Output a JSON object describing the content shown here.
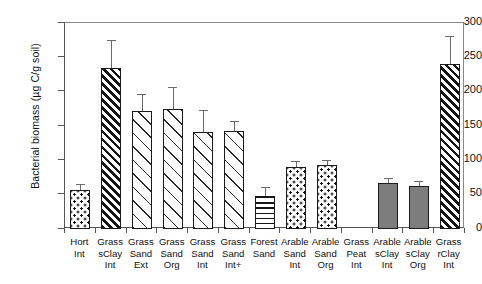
{
  "chart_data": {
    "type": "bar",
    "title": "",
    "xlabel": "",
    "ylabel": "Bacterial biomass (µg C/g soil)",
    "ylim": [
      0,
      300
    ],
    "ytick_labels": [
      "300",
      "250",
      "200",
      "150",
      "100",
      "50",
      "0"
    ],
    "ytick_values": [
      300,
      250,
      200,
      150,
      100,
      50,
      0
    ],
    "grid": false,
    "legend": "none",
    "categories": [
      "Hort Int",
      "Grass sClay Int",
      "Grass Sand Ext",
      "Grass Sand Org",
      "Grass Sand Int",
      "Grass Sand Int+",
      "Forest Sand",
      "Arable Sand Int",
      "Arable Sand Org",
      "Grass Peat Int",
      "Arable sClay Int",
      "Arable sClay Org",
      "Grass rClay Int"
    ],
    "category_lines": [
      [
        "Hort",
        "Int"
      ],
      [
        "Grass",
        "sClay",
        "Int"
      ],
      [
        "Grass",
        "Sand",
        "Ext"
      ],
      [
        "Grass",
        "Sand",
        "Org"
      ],
      [
        "Grass",
        "Sand",
        "Int"
      ],
      [
        "Grass",
        "Sand",
        "Int+"
      ],
      [
        "Forest",
        "Sand"
      ],
      [
        "Arable",
        "Sand",
        "Int"
      ],
      [
        "Arable",
        "Sand",
        "Org"
      ],
      [
        "Grass",
        "Peat",
        "Int"
      ],
      [
        "Arable",
        "sClay",
        "Int"
      ],
      [
        "Arable",
        "sClay",
        "Org"
      ],
      [
        "Grass",
        "rClay",
        "Int"
      ]
    ],
    "values": [
      57,
      234,
      172,
      175,
      141,
      143,
      48,
      90,
      93,
      null,
      67,
      62,
      240
    ],
    "errors_upper": [
      65,
      275,
      197,
      207,
      173,
      158,
      61,
      99,
      101,
      null,
      74,
      70,
      281
    ],
    "fill_patterns": [
      "dots",
      "diagonal-dense",
      "diagonal-open",
      "diagonal-open",
      "diagonal-open",
      "diagonal-open",
      "horizontal-lines",
      "dots",
      "dots",
      "none",
      "solid-gray",
      "solid-gray",
      "diagonal-dense"
    ],
    "colors": {
      "bar_outline": "#1b1b1b",
      "bar_fill_gray": "#7d7d7d",
      "error_bar": "#6a6a6a",
      "axis": "#555555",
      "text": "#111111",
      "background": "#ffffff"
    }
  }
}
